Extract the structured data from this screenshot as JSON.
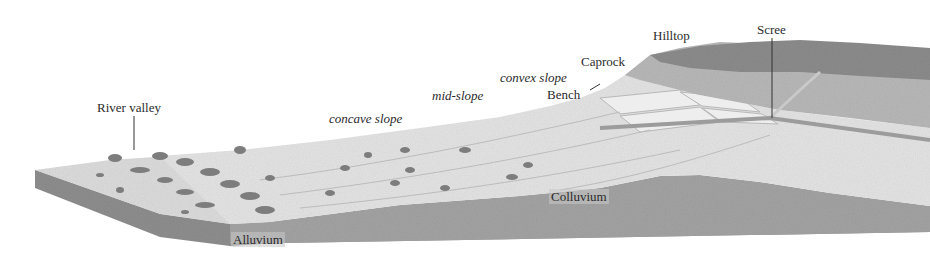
{
  "diagram": {
    "style": "grayscale",
    "colors": {
      "background": "#ffffff",
      "surface_light": "#e6e6e6",
      "surface_mid": "#cfcfcf",
      "caprock": "#b5b5b5",
      "hilltop": "#8c8c8c",
      "block_side": "#9a9a9a",
      "colluvium": "#a5a5a5",
      "vegetation": "#7a7a7a",
      "text": "#2b2b2b"
    },
    "labels": {
      "river_valley": "River valley",
      "concave_slope": "concave slope",
      "mid_slope": "mid-slope",
      "convex_slope": "convex slope",
      "bench": "Bench",
      "caprock": "Caprock",
      "hilltop": "Hilltop",
      "scree": "Scree",
      "colluvium": "Colluvium",
      "alluvium": "Alluvium"
    }
  }
}
